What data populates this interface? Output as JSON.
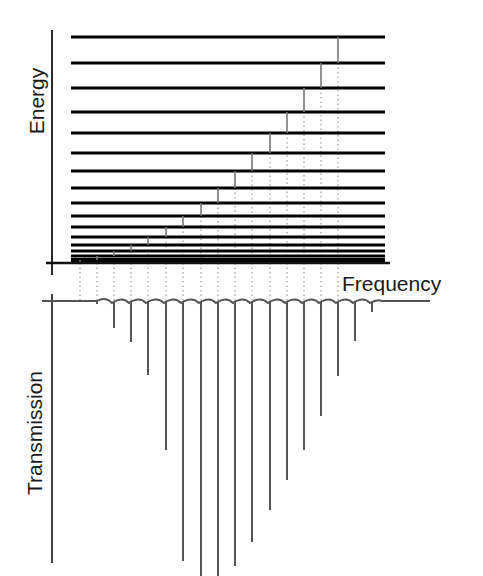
{
  "labels": {
    "energy": "Energy",
    "frequency": "Frequency",
    "transmission": "Transmission"
  },
  "colors": {
    "level": "#000000",
    "axis": "#111111",
    "transition": "#777777",
    "dotted": "#888888",
    "transmission": "#555555"
  },
  "energy_axis": {
    "x": 52,
    "y_top": 30,
    "y_bottom": 275,
    "baseline_y": 263,
    "baseline_x_start": 46,
    "baseline_x_end": 390
  },
  "energy_levels": {
    "x_start": 71,
    "x_end": 385,
    "y": [
      37,
      63,
      88,
      112,
      133,
      153,
      171,
      188,
      203,
      216,
      227,
      237,
      245,
      251,
      256,
      260
    ]
  },
  "transitions": [
    {
      "x": 338,
      "y1": 37,
      "y2": 63
    },
    {
      "x": 321,
      "y1": 63,
      "y2": 88
    },
    {
      "x": 304,
      "y1": 88,
      "y2": 112
    },
    {
      "x": 287,
      "y1": 112,
      "y2": 133
    },
    {
      "x": 270,
      "y1": 133,
      "y2": 153
    },
    {
      "x": 252,
      "y1": 153,
      "y2": 171
    },
    {
      "x": 235,
      "y1": 171,
      "y2": 188
    },
    {
      "x": 218,
      "y1": 188,
      "y2": 203
    },
    {
      "x": 201,
      "y1": 203,
      "y2": 216
    },
    {
      "x": 183,
      "y1": 216,
      "y2": 227
    },
    {
      "x": 166,
      "y1": 227,
      "y2": 237
    },
    {
      "x": 148,
      "y1": 237,
      "y2": 245
    },
    {
      "x": 131,
      "y1": 245,
      "y2": 251
    },
    {
      "x": 114,
      "y1": 251,
      "y2": 256
    },
    {
      "x": 97,
      "y1": 256,
      "y2": 260
    },
    {
      "x": 80,
      "y1": 260,
      "y2": 263
    }
  ],
  "transmission_axis": {
    "x": 52,
    "y_top": 294,
    "y_bottom": 563,
    "baseline_y": 301,
    "baseline_x_start": 42,
    "baseline_x_end": 430
  },
  "transmission_dips": [
    {
      "x": 80,
      "depth": 301
    },
    {
      "x": 97,
      "depth": 304
    },
    {
      "x": 114,
      "depth": 328
    },
    {
      "x": 131,
      "depth": 342
    },
    {
      "x": 148,
      "depth": 375
    },
    {
      "x": 166,
      "depth": 450
    },
    {
      "x": 183,
      "depth": 561
    },
    {
      "x": 201,
      "depth": 576
    },
    {
      "x": 218,
      "depth": 576
    },
    {
      "x": 235,
      "depth": 566
    },
    {
      "x": 252,
      "depth": 542
    },
    {
      "x": 270,
      "depth": 510
    },
    {
      "x": 287,
      "depth": 480
    },
    {
      "x": 304,
      "depth": 450
    },
    {
      "x": 321,
      "depth": 416
    },
    {
      "x": 338,
      "depth": 376
    },
    {
      "x": 355,
      "depth": 341
    },
    {
      "x": 372,
      "depth": 312
    }
  ],
  "dotted_lines": {
    "y_start": 263,
    "y_end": 300,
    "x": [
      80,
      97,
      114,
      131,
      148,
      166,
      183,
      201,
      218,
      235,
      252,
      270,
      287,
      304,
      321,
      338
    ]
  }
}
